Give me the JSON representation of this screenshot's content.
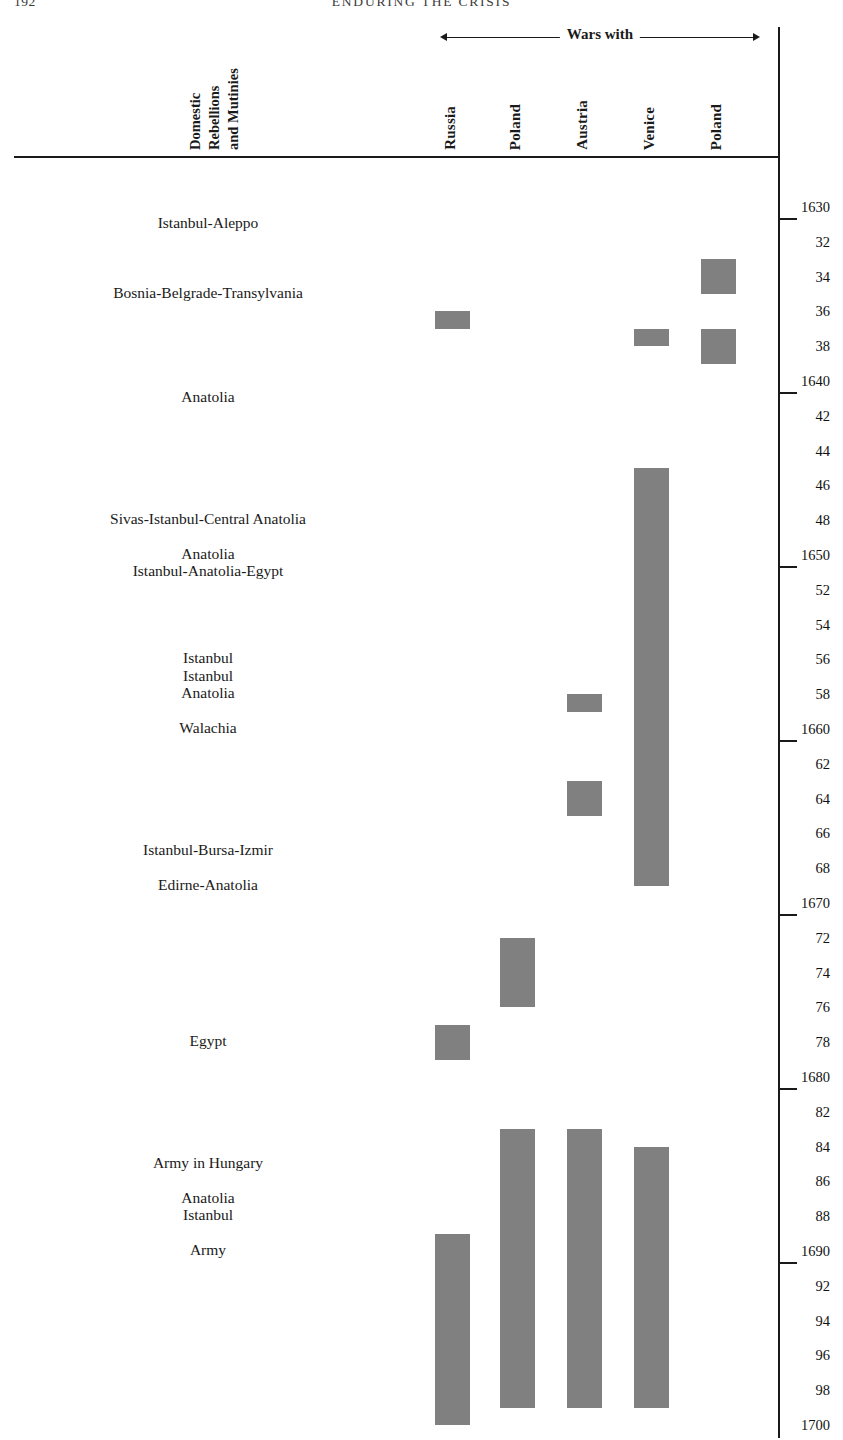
{
  "page": {
    "folio": "192",
    "running_head": "ENDURING THE CRISIS"
  },
  "headers": {
    "domestic_column": "Domestic\nRebellions\nand Mutinies",
    "wars_span": "Wars with"
  },
  "columns": [
    {
      "id": "russia",
      "label": "Russia",
      "x": 452
    },
    {
      "id": "poland1",
      "label": "Poland",
      "x": 517
    },
    {
      "id": "austria",
      "label": "Austria",
      "x": 584
    },
    {
      "id": "venice",
      "label": "Venice",
      "x": 651
    },
    {
      "id": "poland2",
      "label": "Poland",
      "x": 718
    }
  ],
  "year_axis": {
    "start": 1630,
    "end": 1700,
    "step": 2,
    "labels": [
      "1630",
      "32",
      "34",
      "36",
      "38",
      "1640",
      "42",
      "44",
      "46",
      "48",
      "1650",
      "52",
      "54",
      "56",
      "58",
      "1660",
      "62",
      "64",
      "66",
      "68",
      "1670",
      "72",
      "74",
      "76",
      "78",
      "1680",
      "82",
      "84",
      "86",
      "88",
      "1690",
      "92",
      "94",
      "96",
      "98",
      "1700"
    ],
    "decade_ticks": [
      "1630",
      "1640",
      "1650",
      "1660",
      "1670",
      "1680",
      "1690"
    ]
  },
  "colors": {
    "bar": "#808080",
    "axis": "#1a1a1a",
    "text": "#1a1a1a"
  },
  "chart_data": {
    "type": "table",
    "xlabel": "Wars with",
    "ylabel": "Year",
    "ylim": [
      1630,
      1700
    ],
    "grid": false,
    "legend": "none",
    "events": [
      {
        "label": "Istanbul-Aleppo",
        "year": 1631
      },
      {
        "label": "Bosnia-Belgrade-Transylvania",
        "year": 1635
      },
      {
        "label": "Anatolia",
        "year": 1641
      },
      {
        "label": "Sivas-Istanbul-Central Anatolia",
        "year": 1648
      },
      {
        "label": "Anatolia",
        "year": 1650
      },
      {
        "label": "Istanbul-Anatolia-Egypt",
        "year": 1651
      },
      {
        "label": "Istanbul",
        "year": 1656
      },
      {
        "label": "Istanbul",
        "year": 1657
      },
      {
        "label": "Anatolia",
        "year": 1658
      },
      {
        "label": "Walachia",
        "year": 1660
      },
      {
        "label": "Istanbul-Bursa-Izmir",
        "year": 1667
      },
      {
        "label": "Edirne-Anatolia",
        "year": 1669
      },
      {
        "label": "Egypt",
        "year": 1678
      },
      {
        "label": "Army in Hungary",
        "year": 1685
      },
      {
        "label": "Anatolia",
        "year": 1687
      },
      {
        "label": "Istanbul",
        "year": 1688
      },
      {
        "label": "Army",
        "year": 1690
      }
    ],
    "wars": [
      {
        "column": "poland2",
        "start_year": 1633,
        "end_year": 1635
      },
      {
        "column": "russia",
        "start_year": 1636,
        "end_year": 1637
      },
      {
        "column": "venice",
        "start_year": 1637,
        "end_year": 1638
      },
      {
        "column": "poland2",
        "start_year": 1637,
        "end_year": 1639
      },
      {
        "column": "venice",
        "start_year": 1645,
        "end_year": 1669
      },
      {
        "column": "austria",
        "start_year": 1658,
        "end_year": 1659
      },
      {
        "column": "austria",
        "start_year": 1663,
        "end_year": 1665
      },
      {
        "column": "poland1",
        "start_year": 1672,
        "end_year": 1676
      },
      {
        "column": "russia",
        "start_year": 1677,
        "end_year": 1679
      },
      {
        "column": "poland1",
        "start_year": 1683,
        "end_year": 1699
      },
      {
        "column": "austria",
        "start_year": 1683,
        "end_year": 1699
      },
      {
        "column": "venice",
        "start_year": 1684,
        "end_year": 1699
      },
      {
        "column": "russia",
        "start_year": 1689,
        "end_year": 1700
      }
    ]
  }
}
